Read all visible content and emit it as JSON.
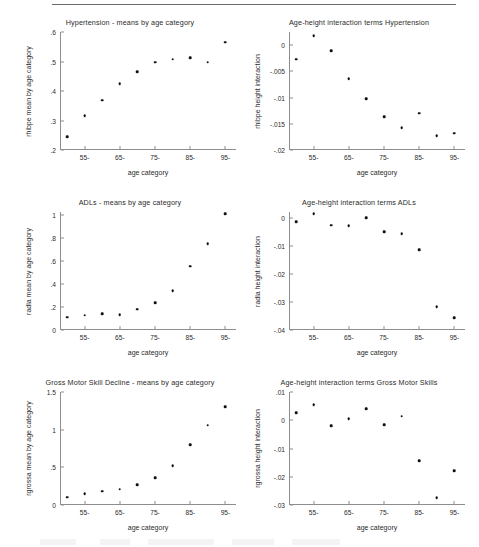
{
  "figure": {
    "top_rule": true,
    "background_color": "#ffffff",
    "marker_color": "#111111",
    "axis_color": "#8d8d8d",
    "text_color": "#2b2b2b"
  },
  "chart_data": [
    {
      "type": "scatter",
      "panel": "top-left",
      "title": "Hypertension - means by age category",
      "xlabel": "age category",
      "ylabel": "rhibpe mean by age category",
      "xticks": [
        "55-",
        "65-",
        "75-",
        "85-",
        "95-"
      ],
      "xtick_values": [
        55,
        65,
        75,
        85,
        95
      ],
      "yticks": [
        ".2",
        ".3",
        ".4",
        ".5",
        ".6"
      ],
      "ytick_values": [
        0.2,
        0.3,
        0.4,
        0.5,
        0.6
      ],
      "ylim": [
        0.2,
        0.6
      ],
      "xlim": [
        48,
        98
      ],
      "grid": false,
      "legend": "none",
      "x": [
        50,
        55,
        60,
        65,
        70,
        75,
        80,
        85,
        90,
        95
      ],
      "values": [
        0.244,
        0.315,
        0.368,
        0.425,
        0.465,
        0.498,
        0.508,
        0.512,
        0.497,
        0.565
      ]
    },
    {
      "type": "scatter",
      "panel": "top-right",
      "title": "Age-height interaction terms Hypertension",
      "xlabel": "age category",
      "ylabel": "rhibpe height interaction",
      "xticks": [
        "55-",
        "65-",
        "75-",
        "85-",
        "95-"
      ],
      "xtick_values": [
        55,
        65,
        75,
        85,
        95
      ],
      "yticks": [
        "0",
        "-.005",
        "-.01",
        "-.015",
        "-.02"
      ],
      "ytick_values": [
        0,
        -0.005,
        -0.01,
        -0.015,
        -0.02
      ],
      "ylim": [
        -0.02,
        0.0025
      ],
      "xlim": [
        48,
        98
      ],
      "grid": false,
      "legend": "none",
      "x": [
        50,
        55,
        60,
        65,
        70,
        75,
        80,
        85,
        90,
        95
      ],
      "values": [
        -0.0027,
        0.0018,
        -0.0011,
        -0.0064,
        -0.0102,
        -0.0137,
        -0.0158,
        -0.013,
        -0.0173,
        -0.0168
      ]
    },
    {
      "type": "scatter",
      "panel": "middle-left",
      "title": "ADLs - means by age category",
      "xlabel": "age category",
      "ylabel": "radla mean by age category",
      "xticks": [
        "55-",
        "65-",
        "75-",
        "85-",
        "95-"
      ],
      "xtick_values": [
        55,
        65,
        75,
        85,
        95
      ],
      "yticks": [
        "0",
        ".2",
        ".4",
        ".6",
        ".8",
        "1"
      ],
      "ytick_values": [
        0,
        0.2,
        0.4,
        0.6,
        0.8,
        1.0
      ],
      "ylim": [
        0,
        1.03
      ],
      "xlim": [
        48,
        98
      ],
      "grid": false,
      "legend": "none",
      "x": [
        50,
        55,
        60,
        65,
        70,
        75,
        80,
        85,
        90,
        95
      ],
      "values": [
        0.11,
        0.13,
        0.14,
        0.135,
        0.18,
        0.24,
        0.34,
        0.555,
        0.75,
        1.015
      ]
    },
    {
      "type": "scatter",
      "panel": "middle-right",
      "title": "Age-height interaction terms ADLs",
      "xlabel": "age category",
      "ylabel": "radla height interaction",
      "xticks": [
        "55-",
        "65-",
        "75-",
        "85-",
        "95-"
      ],
      "xtick_values": [
        55,
        65,
        75,
        85,
        95
      ],
      "yticks": [
        "0",
        "-.01",
        "-.02",
        "-.03",
        "-.04"
      ],
      "ytick_values": [
        0,
        -0.01,
        -0.02,
        -0.03,
        -0.04
      ],
      "ylim": [
        -0.04,
        0.0022
      ],
      "xlim": [
        48,
        98
      ],
      "grid": false,
      "legend": "none",
      "x": [
        50,
        55,
        60,
        65,
        70,
        75,
        80,
        85,
        90,
        95
      ],
      "values": [
        -0.0013,
        0.0016,
        -0.0026,
        -0.0027,
        0.0002,
        -0.0048,
        -0.0055,
        -0.0113,
        -0.0318,
        -0.0357
      ]
    },
    {
      "type": "scatter",
      "panel": "bottom-left",
      "title": "Gross Motor Skill Decline - means by age category",
      "xlabel": "age category",
      "ylabel": "rgrossa mean by age category",
      "xticks": [
        "55-",
        "65-",
        "75-",
        "85-",
        "95-"
      ],
      "xtick_values": [
        55,
        65,
        75,
        85,
        95
      ],
      "yticks": [
        "0",
        ".5",
        "1",
        "1.5"
      ],
      "ytick_values": [
        0,
        0.5,
        1.0,
        1.5
      ],
      "ylim": [
        0,
        1.5
      ],
      "xlim": [
        48,
        98
      ],
      "grid": false,
      "legend": "none",
      "x": [
        50,
        55,
        60,
        65,
        70,
        75,
        80,
        85,
        90,
        95
      ],
      "values": [
        0.1,
        0.15,
        0.18,
        0.21,
        0.27,
        0.36,
        0.52,
        0.8,
        1.06,
        1.3
      ]
    },
    {
      "type": "scatter",
      "panel": "bottom-right",
      "title": "Age-height interaction terms Gross Motor Skills",
      "xlabel": "age category",
      "ylabel": "rgrossa height interaction",
      "xticks": [
        "55-",
        "65-",
        "75-",
        "85-",
        "95-"
      ],
      "xtick_values": [
        55,
        65,
        75,
        85,
        95
      ],
      "yticks": [
        ".01",
        "0",
        "-.01",
        "-.02",
        "-.03"
      ],
      "ytick_values": [
        0.01,
        0,
        -0.01,
        -0.02,
        -0.03
      ],
      "ylim": [
        -0.03,
        0.01
      ],
      "xlim": [
        48,
        98
      ],
      "grid": false,
      "legend": "none",
      "x": [
        50,
        55,
        60,
        65,
        70,
        75,
        80,
        85,
        90,
        95
      ],
      "values": [
        0.0027,
        0.0054,
        -0.002,
        0.0006,
        0.004,
        -0.0016,
        0.0014,
        -0.0144,
        -0.0275,
        -0.0178
      ]
    }
  ]
}
